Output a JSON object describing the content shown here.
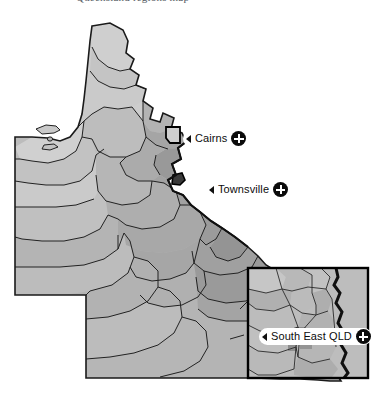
{
  "header": {
    "caption": "Queensland regions map"
  },
  "map": {
    "title": "Queensland administrative regions",
    "region_name": "Queensland",
    "background_color": "#ffffff",
    "fill_light": "#d2d2d2",
    "fill_mid": "#b8b8b8",
    "fill_dark": "#a0a0a0",
    "fill_darker": "#8e8e8e",
    "outline_color": "#1a1a1a",
    "inset": {
      "name": "south-east-qld-inset",
      "border_color": "#000000",
      "x": 248,
      "y": 259,
      "width": 120,
      "height": 110
    }
  },
  "callouts": [
    {
      "id": "cairns",
      "label": "Cairns",
      "arrow": "left-triangle",
      "button_icon": "plus-circle-icon",
      "x": 183,
      "y": 121
    },
    {
      "id": "townsville",
      "label": "Townsville",
      "arrow": "left-triangle",
      "button_icon": "plus-circle-icon",
      "x": 206,
      "y": 172
    },
    {
      "id": "southeast",
      "label": "South East QLD",
      "arrow": "left-triangle",
      "button_icon": "plus-circle-icon",
      "x": 259,
      "y": 319
    }
  ]
}
